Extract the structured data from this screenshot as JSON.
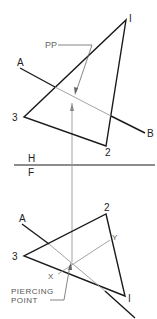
{
  "diagram": {
    "colors": {
      "main": "#1a1a1a",
      "construction": "#999999",
      "label": "#222222",
      "leader": "#666666"
    },
    "fold_line": {
      "upper_label": "H",
      "lower_label": "F"
    },
    "top_view": {
      "vertices": [
        {
          "id": "1",
          "label": "I",
          "x": 126,
          "y": 20
        },
        {
          "id": "2",
          "label": "2",
          "x": 106,
          "y": 146
        },
        {
          "id": "3",
          "label": "3",
          "x": 24,
          "y": 117
        }
      ],
      "line": {
        "start_label": "A",
        "end_label": "B"
      },
      "annotation": "PP"
    },
    "front_view": {
      "vertices": [
        {
          "id": "1",
          "label": "I",
          "x": 125,
          "y": 296
        },
        {
          "id": "2",
          "label": "2",
          "x": 106,
          "y": 214
        },
        {
          "id": "3",
          "label": "3",
          "x": 24,
          "y": 256
        }
      ],
      "line": {
        "start_label": "A"
      },
      "points": [
        {
          "label": "X"
        },
        {
          "label": "Y"
        }
      ],
      "annotation_line1": "PIERCING",
      "annotation_line2": "POINT"
    }
  }
}
